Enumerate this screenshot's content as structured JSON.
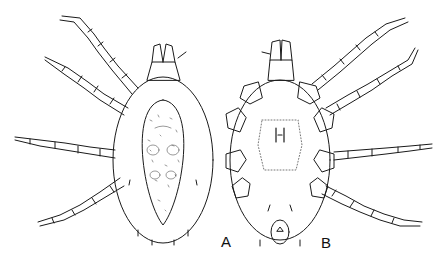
{
  "figure": {
    "panels": [
      {
        "id": "A",
        "label": "A",
        "view": "dorsal"
      },
      {
        "id": "B",
        "label": "B",
        "view": "ventral"
      }
    ],
    "colors": {
      "line": "#1a1a1a",
      "background": "#ffffff",
      "stipple": "#555555"
    }
  }
}
